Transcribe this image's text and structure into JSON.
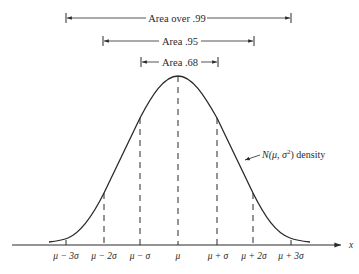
{
  "figure": {
    "type": "normal-distribution-diagram",
    "curve_label": {
      "prefix": "N(",
      "mu": "μ",
      "sep": ", ",
      "sigma": "σ",
      "sup": "2",
      "suffix": ") density",
      "full": "N(μ, σ²) density"
    },
    "x_axis_label": "x",
    "brackets": [
      {
        "label": "Area over .99",
        "from": "μ − 3σ",
        "to": "μ + 3σ"
      },
      {
        "label": "Area .95",
        "from": "μ − 2σ",
        "to": "μ + 2σ"
      },
      {
        "label": "Area .68",
        "from": "μ − σ",
        "to": "μ + σ"
      }
    ],
    "ticks": [
      {
        "label": "μ − 3σ",
        "k": -3
      },
      {
        "label": "μ − 2σ",
        "k": -2
      },
      {
        "label": "μ − σ",
        "k": -1
      },
      {
        "label": "μ",
        "k": 0
      },
      {
        "label": "μ + σ",
        "k": 1
      },
      {
        "label": "μ + 2σ",
        "k": 2
      },
      {
        "label": "μ + 3σ",
        "k": 3
      }
    ],
    "colors": {
      "ink": "#2a2a2a",
      "background": "#ffffff"
    }
  }
}
